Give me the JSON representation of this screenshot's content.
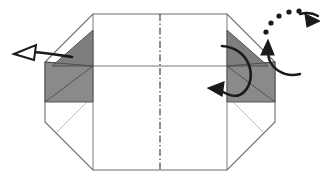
{
  "figure": {
    "background_color": "#ffffff"
  },
  "colors": {
    "paper_fill": "#ffffff",
    "paper_outline": "#6b6b6b",
    "crease_line": "#b8b8b8",
    "shaded_fill": "#8a8a8a",
    "shaded_fill_dark": "#7e7e7e",
    "shaded_outline": "#4a4a4a",
    "arrow_stroke": "#1a1a1a",
    "fold_axis": "#3a3a3a"
  },
  "geometry": {
    "octagon_outline": {
      "label": "paper-outline",
      "points": "93,14 227,14 275,62 275,122 227,170 93,170 45,122 45,62",
      "stroke_width": 1.1
    },
    "fold_axis_vertical": {
      "label": "center-fold-axis",
      "x": 160,
      "y1": 14,
      "y2": 170,
      "dash": "7,2.5,1.5,2.5"
    },
    "horizontal_midline": {
      "label": "horizontal-crease",
      "x1": 45,
      "x2": 275,
      "y": 66,
      "stroke_width": 0.9
    },
    "left_vertical_crease": {
      "x": 93,
      "y1": 14,
      "y2": 170
    },
    "right_vertical_crease": {
      "x": 227,
      "y1": 14,
      "y2": 170
    },
    "left_lower_crease": "56,133 93,96",
    "right_lower_crease": "264,133 227,96",
    "left_flap_upper": {
      "label": "left-flap-upper-triangle",
      "points": "93,30 93,66 52,66"
    },
    "left_flap_lower": {
      "label": "left-flap-lower-triangle",
      "points": "93,66 93,102 45,102 45,62"
    },
    "left_flap_inner": {
      "label": "left-flap-inner-fold",
      "points": "45,62 93,66 45,102"
    },
    "right_flap_upper": {
      "label": "right-flap-upper-triangle",
      "points": "227,30 227,66 268,66"
    },
    "right_flap_lower": {
      "label": "right-flap-lower-triangle",
      "points": "227,66 227,102 275,102 275,62"
    },
    "right_flap_inner": {
      "label": "right-flap-inner-fold",
      "points": "275,62 227,66 275,102"
    }
  },
  "arrows": {
    "pull_out_arrow": {
      "name": "pull-out-arrow",
      "style": "hollow-outline-arrowhead",
      "direction": "left",
      "tail_path": "M 72,57 C 58,55 46,53 34,52",
      "head_points": "14,54 36,45 34,60",
      "stroke_width": 2.6
    },
    "fold_loop_arrow": {
      "name": "fold-loop-arrow",
      "style": "solid-filled-arrowhead",
      "direction": "counterclockwise-left",
      "tail_path": "M 222,46 C 250,48 258,78 244,92 C 236,100 226,94 220,90",
      "head_points": "208,88 224,82 222,96",
      "stroke_width": 2.6
    },
    "rotate_symbol": {
      "name": "rotate-turn-over-symbol",
      "center_x": 288,
      "center_y": 48,
      "radius": 27,
      "solid_arc_path": "M 300,74 C 284,78 268,68 268,52",
      "solid_head_points": "268,40 274,55 261,55",
      "dotted_points": [
        [
          266,
          32
        ],
        [
          271,
          23
        ],
        [
          279,
          16
        ],
        [
          289,
          12
        ],
        [
          299,
          11
        ]
      ],
      "dotted_radius": 2.6,
      "dotted_head_points": "320,21 305,14 307,27",
      "dotted_head_path": "M 300,14 C 307,12 313,13 318,16",
      "stroke_width": 2.4
    }
  },
  "labels": {
    "caption": ""
  }
}
